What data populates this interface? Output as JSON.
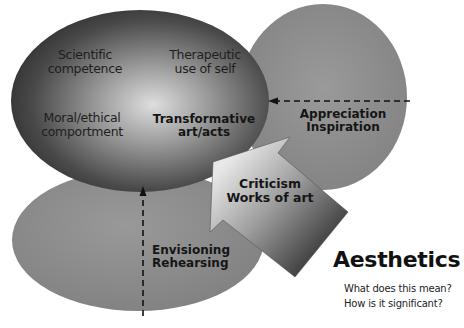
{
  "diagram": {
    "central_ellipse": {
      "labels": [
        {
          "id": "scientific",
          "lines": [
            "Scientific",
            "competence"
          ]
        },
        {
          "id": "therapeutic",
          "lines": [
            "Therapeutic",
            "use of self"
          ]
        },
        {
          "id": "moral",
          "lines": [
            "Moral/ethical",
            "comportment"
          ]
        },
        {
          "id": "transformative",
          "lines": [
            "Transformative",
            "art/acts"
          ]
        }
      ]
    },
    "right_ellipse": {
      "lines": [
        "Appreciation",
        "Inspiration"
      ]
    },
    "bottom_ellipse": {
      "lines": [
        "Envisioning",
        "Rehearsing"
      ]
    },
    "arrow": {
      "lines": [
        "Criticism",
        "Works of art"
      ]
    },
    "title": "Aesthetics",
    "questions": [
      "What does this mean?",
      "How is it significant?"
    ],
    "colors": {
      "central_dark": "#2b2b2b",
      "central_light": "#d8d8d8",
      "side_ellipse": "#8a8a8a",
      "arrow_light": "#e0e0e0",
      "arrow_dark": "#3a3a3a",
      "text": "#151515"
    }
  }
}
